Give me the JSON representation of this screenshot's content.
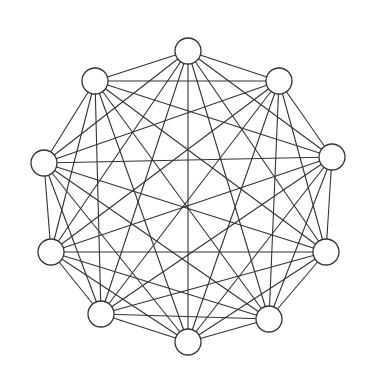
{
  "diagram": {
    "type": "complete-graph",
    "name": "K10",
    "node_count": 10,
    "edge_count": 45,
    "node_radius": 13,
    "stroke_color": "#333333",
    "node_fill": "#ffffff",
    "background": "#ffffff",
    "nodes": [
      {
        "id": "n1",
        "x": 188,
        "y": 51
      },
      {
        "id": "n2",
        "x": 279,
        "y": 81
      },
      {
        "id": "n3",
        "x": 332,
        "y": 157
      },
      {
        "id": "n4",
        "x": 326,
        "y": 252
      },
      {
        "id": "n5",
        "x": 269,
        "y": 319
      },
      {
        "id": "n6",
        "x": 188,
        "y": 342
      },
      {
        "id": "n7",
        "x": 101,
        "y": 314
      },
      {
        "id": "n8",
        "x": 51,
        "y": 252
      },
      {
        "id": "n9",
        "x": 44,
        "y": 163
      },
      {
        "id": "n10",
        "x": 95,
        "y": 81
      }
    ]
  }
}
